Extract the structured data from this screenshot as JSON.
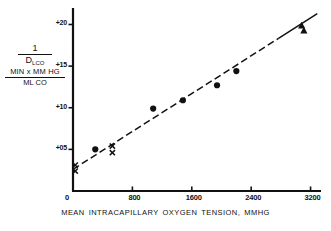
{
  "figure": {
    "y_axis_label": {
      "upper_numerator": "1",
      "upper_denominator_main": "D",
      "upper_denominator_sub": "L",
      "upper_denominator_sub2": "CO",
      "lower_numerator": "MIN x MM HG",
      "lower_denominator": "ML CO"
    },
    "x_axis_title": "MEAN  INTRACAPILLARY OXYGEN TENSION, MMHG",
    "origin_label": "0"
  },
  "chart_data": {
    "type": "scatter",
    "title": "",
    "xlabel": "MEAN  INTRACAPILLARY OXYGEN TENSION, MMHG",
    "ylabel": "1 / DL,CO  (MIN x MM HG / ML CO)",
    "xlim": [
      0,
      3300
    ],
    "ylim": [
      0,
      21.5
    ],
    "xticks": [
      0,
      800,
      1600,
      2400,
      3200
    ],
    "xtick_labels": [
      "0",
      "800",
      "1600",
      "2400",
      "3200"
    ],
    "yticks": [
      5,
      10,
      15,
      20
    ],
    "ytick_labels": [
      "+05",
      "+10",
      "+15",
      "+20"
    ],
    "grid": false,
    "legend_position": "none",
    "series": [
      {
        "name": "x-marker group",
        "marker": "x",
        "points": [
          {
            "x": 30,
            "y": 3.1
          },
          {
            "x": 30,
            "y": 2.4
          },
          {
            "x": 530,
            "y": 5.4
          },
          {
            "x": 530,
            "y": 4.6
          }
        ]
      },
      {
        "name": "filled-circle group",
        "marker": "circle",
        "points": [
          {
            "x": 300,
            "y": 5.0
          },
          {
            "x": 1080,
            "y": 9.9
          },
          {
            "x": 1480,
            "y": 10.9
          },
          {
            "x": 1940,
            "y": 12.7
          },
          {
            "x": 2200,
            "y": 14.4
          }
        ]
      },
      {
        "name": "filled-triangle group",
        "marker": "triangle",
        "points": [
          {
            "x": 3080,
            "y": 19.9
          },
          {
            "x": 3110,
            "y": 19.3
          }
        ]
      }
    ],
    "fit_line": {
      "name": "regression line",
      "style": "dashed-lower-solid-upper",
      "x_start": 0,
      "y_start": 2.6,
      "x_end": 3290,
      "y_end": 21.3
    }
  }
}
